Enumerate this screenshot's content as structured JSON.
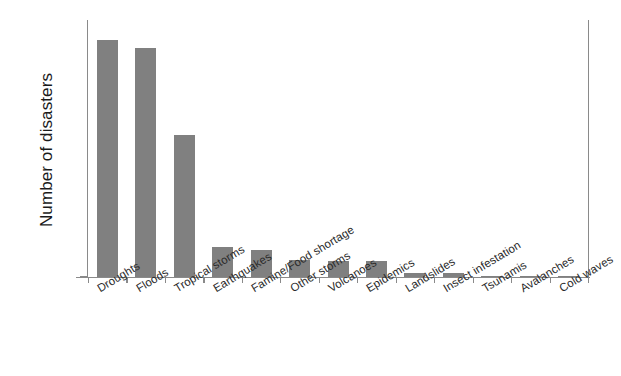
{
  "chart_data": {
    "type": "bar",
    "title": "",
    "xlabel": "",
    "ylabel": "Number of disasters",
    "ylim": [
      0,
      180
    ],
    "ytick_step": 20,
    "yticks": [
      180,
      160,
      140,
      120,
      100,
      80,
      60,
      40,
      20,
      0
    ],
    "grid": false,
    "legend": null,
    "bar_color": "#808080",
    "axis_color": "#8a8a8a",
    "xtick_label_rotation_deg": -31,
    "categories": [
      "Droughts",
      "Floods",
      "Tropical storms",
      "Earthquakes",
      "Famine/Food shortage",
      "Other storms",
      "Volcanoes",
      "Epidemics",
      "Landslides",
      "Insect infestation",
      "Tsunamis",
      "Avalanches",
      "Cold waves"
    ],
    "values": [
      167,
      162,
      100,
      21,
      19,
      12,
      11,
      11,
      3,
      3,
      1,
      1,
      1
    ]
  }
}
